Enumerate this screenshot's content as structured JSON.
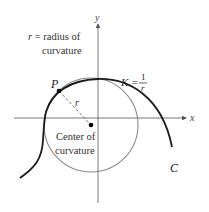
{
  "figure": {
    "axes": {
      "x_label": "x",
      "y_label": "y"
    },
    "radius_label": {
      "var": "r",
      "text": " = radius of",
      "line2": "curvature"
    },
    "point_label": "P",
    "r_label": "r",
    "center_label": {
      "line1": "Center of",
      "line2": "curvature"
    },
    "curvature_formula": {
      "lhs": "K =",
      "numerator": "1",
      "denominator": "r"
    },
    "curve_label": "C",
    "colors": {
      "curve": "#1a1a1a",
      "circle": "#8a8a8a",
      "axes": "#555555",
      "radius": "#777777"
    }
  }
}
